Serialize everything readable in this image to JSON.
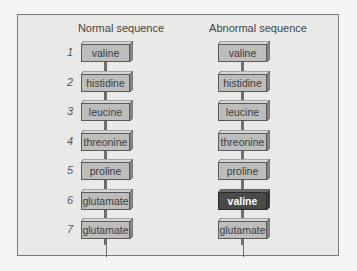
{
  "normal": {
    "title": "Normal sequence",
    "items": [
      {
        "n": "1",
        "label": "valine"
      },
      {
        "n": "2",
        "label": "histidine"
      },
      {
        "n": "3",
        "label": "leucine"
      },
      {
        "n": "4",
        "label": "threonine"
      },
      {
        "n": "5",
        "label": "proline"
      },
      {
        "n": "6",
        "label": "glutamate"
      },
      {
        "n": "7",
        "label": "glutamate"
      }
    ]
  },
  "abnormal": {
    "title": "Abnormal sequence",
    "items": [
      {
        "label": "valine"
      },
      {
        "label": "histidine"
      },
      {
        "label": "leucine"
      },
      {
        "label": "threonine"
      },
      {
        "label": "proline"
      },
      {
        "label": "valine",
        "highlight": true
      },
      {
        "label": "glutamate"
      }
    ]
  },
  "colors": {
    "box_fill": "#bdbdbc",
    "mutant_fill": "#4a4a4a",
    "panel_bg": "#e9e9e8"
  }
}
